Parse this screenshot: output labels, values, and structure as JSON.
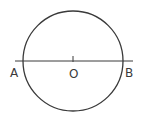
{
  "diagram": {
    "type": "geometry",
    "colors": {
      "stroke": "#3a3a3a",
      "background": "#ffffff"
    },
    "circle": {
      "cx": 73,
      "cy": 61,
      "r": 50
    },
    "line": {
      "x1": 15,
      "y1": 61,
      "x2": 133,
      "y2": 61
    },
    "center_tick": {
      "x": 73,
      "y1": 56,
      "y2": 62
    },
    "labels": {
      "A": "A",
      "O": "O",
      "B": "B"
    }
  }
}
